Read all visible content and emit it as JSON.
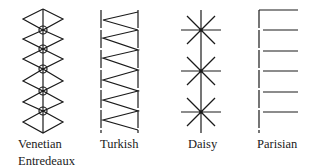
{
  "figure": {
    "stitches": [
      {
        "id": "venetian",
        "label_lines": [
          "Venetian",
          "Entredeaux"
        ]
      },
      {
        "id": "turkish",
        "label_lines": [
          "Turkish"
        ]
      },
      {
        "id": "daisy",
        "label_lines": [
          "Daisy"
        ]
      },
      {
        "id": "parisian",
        "label_lines": [
          "Parisian"
        ]
      }
    ]
  }
}
